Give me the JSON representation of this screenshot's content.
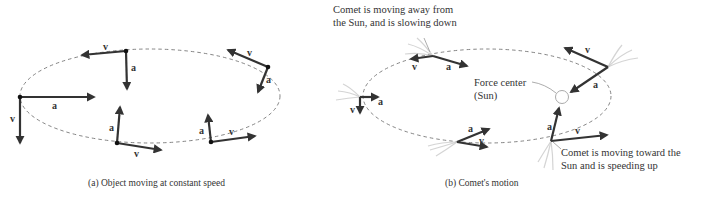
{
  "panel_a": {
    "caption": "(a) Object moving at constant speed",
    "labels": {
      "v": "v",
      "a": "a"
    }
  },
  "panel_b": {
    "caption": "(b) Comet's motion",
    "labels": {
      "v": "v",
      "a": "a"
    },
    "annotations": {
      "away_line1": "Comet is moving away from",
      "away_line2": "the Sun, and is slowing down",
      "force_center_line1": "Force center",
      "force_center_line2": "(Sun)",
      "toward_line1": "Comet is moving toward the",
      "toward_line2": "Sun and is speeding up"
    }
  },
  "colors": {
    "vector": "#333333",
    "orbit": "#777777",
    "text": "#333333"
  }
}
